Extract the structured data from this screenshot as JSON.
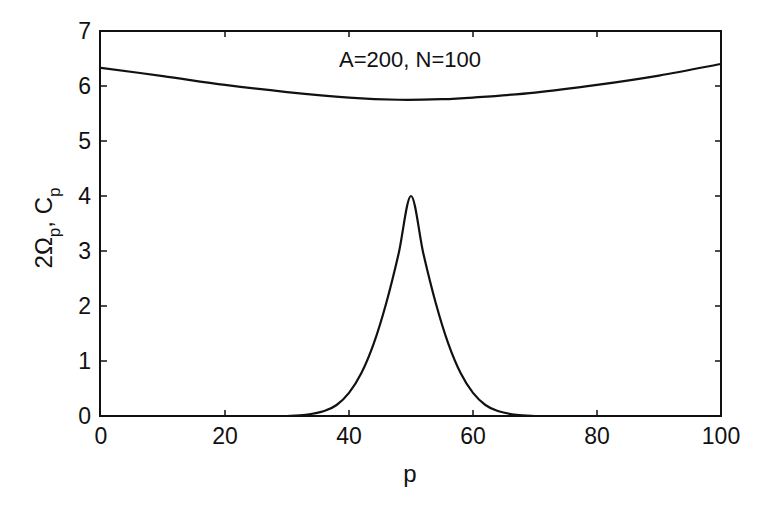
{
  "chart_data": {
    "type": "line",
    "title": "",
    "annotation": "A=200, N=100",
    "xlabel": "p",
    "ylabel": {
      "main1": "2Ω",
      "sub1": "p",
      "sep": ", C",
      "sub2": "p"
    },
    "xlim": [
      0,
      100
    ],
    "ylim": [
      0,
      7
    ],
    "xticks": [
      0,
      20,
      40,
      60,
      80,
      100
    ],
    "yticks": [
      0,
      1,
      2,
      3,
      4,
      5,
      6,
      7
    ],
    "xtick_labels": [
      "0",
      "20",
      "40",
      "60",
      "80",
      "100"
    ],
    "ytick_labels": [
      "0",
      "1",
      "2",
      "3",
      "4",
      "5",
      "6",
      "7"
    ],
    "grid": false,
    "colors": {
      "line": "#111111",
      "axis": "#111111"
    },
    "series": [
      {
        "name": "2Ω_p",
        "x": [
          0,
          10,
          20,
          30,
          40,
          48,
          55,
          60,
          70,
          80,
          90,
          100
        ],
        "y": [
          6.33,
          6.18,
          6.02,
          5.89,
          5.79,
          5.75,
          5.76,
          5.79,
          5.88,
          6.02,
          6.19,
          6.4
        ]
      },
      {
        "name": "C_p",
        "x": [
          30,
          33,
          36,
          38,
          40,
          42,
          44,
          46,
          48,
          50,
          52,
          54,
          56,
          58,
          60,
          62,
          64,
          67,
          70
        ],
        "y": [
          0.0,
          0.02,
          0.09,
          0.2,
          0.42,
          0.78,
          1.32,
          2.05,
          2.95,
          4.0,
          2.95,
          2.05,
          1.32,
          0.78,
          0.42,
          0.2,
          0.09,
          0.02,
          0.0
        ]
      }
    ]
  }
}
